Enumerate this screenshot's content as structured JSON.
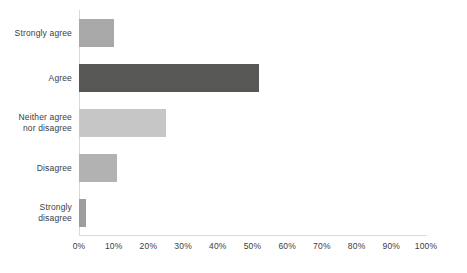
{
  "chart_data": {
    "type": "bar",
    "orientation": "horizontal",
    "title": "",
    "subtitle": "",
    "xlabel": "",
    "ylabel": "",
    "categories": [
      "Strongly agree",
      "Agree",
      "Neither agree\nnor disagree",
      "Disagree",
      "Strongly\ndisagree"
    ],
    "values": [
      10,
      52,
      25,
      11,
      2
    ],
    "value_unit": "%",
    "xlim": [
      0,
      100
    ],
    "xticks": [
      0,
      10,
      20,
      30,
      40,
      50,
      60,
      70,
      80,
      90,
      100
    ],
    "xtick_labels": [
      "0%",
      "10%",
      "20%",
      "30%",
      "40%",
      "50%",
      "60%",
      "70%",
      "80%",
      "90%",
      "100%"
    ],
    "grid": false,
    "legend": null,
    "bar_colors": [
      "#a8a8a8",
      "#575756",
      "#c6c6c6",
      "#b2b2b2",
      "#9d9d9c"
    ],
    "axis_color": "#d9d9d9",
    "text_color": "#3c3c3b",
    "background": "#ffffff"
  }
}
